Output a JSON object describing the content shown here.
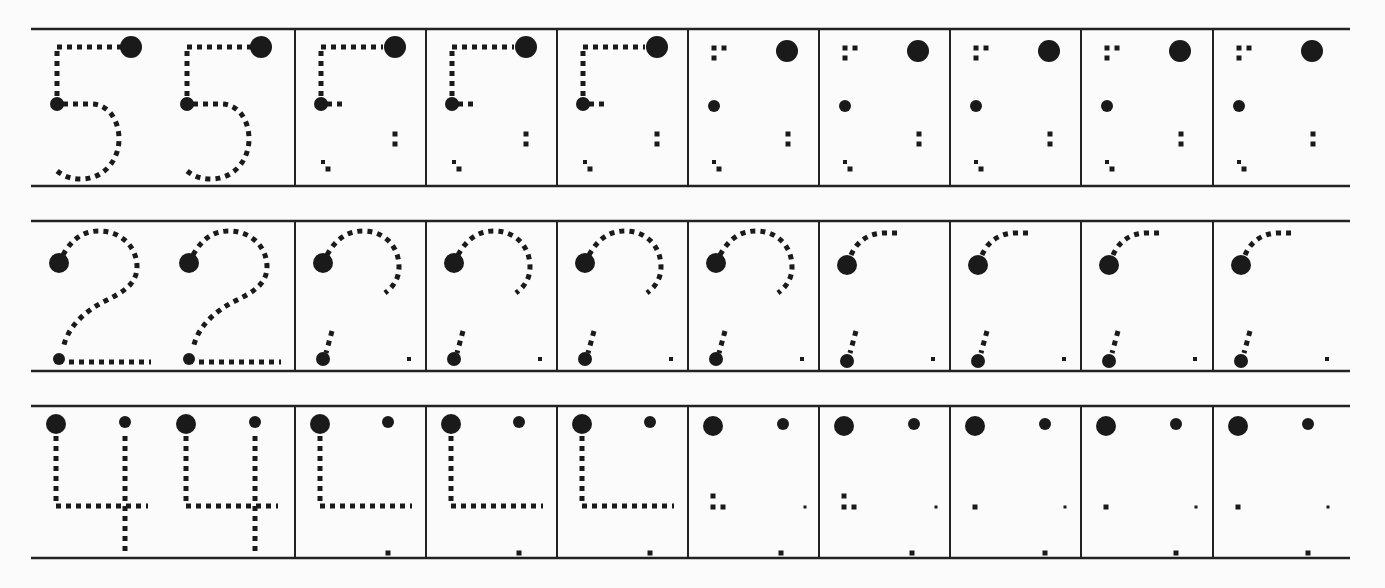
{
  "worksheet": {
    "type": "number-tracing-practice",
    "ink_color": "#1a1a1a",
    "line_color": "#222222",
    "paper_color": "#fbfbfb",
    "grid": {
      "left": 31,
      "right": 1350,
      "dividers": [
        295,
        426,
        557,
        688,
        819,
        950,
        1081,
        1213
      ],
      "first_cell_glyph_offsets": [
        26,
        156
      ],
      "column_glyph_offset": 26
    },
    "rows": [
      {
        "digit": "5",
        "top": 29,
        "bottom": 186,
        "columns": 10,
        "stages": [
          "full",
          "full",
          "partial-1",
          "partial-1",
          "partial-1",
          "partial-2",
          "partial-2",
          "partial-2",
          "partial-2",
          "partial-2"
        ]
      },
      {
        "digit": "2",
        "top": 221,
        "bottom": 371,
        "columns": 10,
        "stages": [
          "full",
          "full",
          "partial-1",
          "partial-1",
          "partial-1",
          "partial-1",
          "partial-2",
          "partial-2",
          "partial-2",
          "partial-2"
        ]
      },
      {
        "digit": "4",
        "top": 406,
        "bottom": 558,
        "columns": 10,
        "stages": [
          "full",
          "full",
          "partial-1",
          "partial-1",
          "partial-1",
          "partial-2",
          "partial-2",
          "partial-3",
          "partial-3",
          "partial-3"
        ]
      }
    ]
  }
}
